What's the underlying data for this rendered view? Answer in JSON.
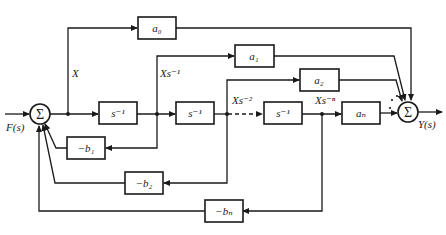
{
  "diagram": {
    "type": "block-diagram",
    "input_label": "F(s)",
    "output_label": "Y(s)",
    "sum_symbol": "Σ",
    "signals": {
      "x": "X",
      "x1": "Xs⁻¹",
      "x2": "Xs⁻²",
      "xn": "Xs⁻ⁿ"
    },
    "integrators": [
      {
        "label": "s⁻¹"
      },
      {
        "label": "s⁻¹"
      },
      {
        "label": "s⁻¹"
      }
    ],
    "feedforward_gains": [
      {
        "label": "a₀"
      },
      {
        "label": "a₁"
      },
      {
        "label": "a₂"
      },
      {
        "label": "aₙ"
      }
    ],
    "feedback_gains": [
      {
        "label": "−b₁"
      },
      {
        "label": "−b₂"
      },
      {
        "label": "−bₙ"
      }
    ],
    "ellipsis": "⋰"
  }
}
